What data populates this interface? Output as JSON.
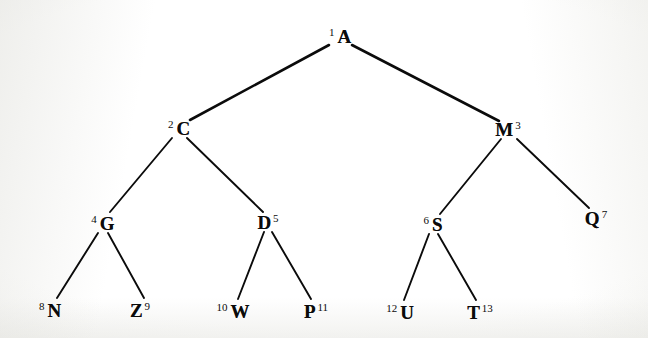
{
  "diagram": {
    "type": "tree",
    "width": 648,
    "height": 338,
    "background_color": "#fbfbf9",
    "ink_color": "#0b0b0b",
    "nodes": [
      {
        "id": "A",
        "label": "A",
        "number": "1",
        "number_side": "left",
        "x": 340,
        "y": 36,
        "level": 0
      },
      {
        "id": "C",
        "label": "C",
        "number": "2",
        "number_side": "left",
        "x": 179,
        "y": 128,
        "level": 1
      },
      {
        "id": "M",
        "label": "M",
        "number": "3",
        "number_side": "right",
        "x": 508,
        "y": 129,
        "level": 1
      },
      {
        "id": "G",
        "label": "G",
        "number": "4",
        "number_side": "left",
        "x": 103,
        "y": 223,
        "level": 2
      },
      {
        "id": "D",
        "label": "D",
        "number": "5",
        "number_side": "right",
        "x": 268,
        "y": 222,
        "level": 2
      },
      {
        "id": "S",
        "label": "S",
        "number": "6",
        "number_side": "left",
        "x": 433,
        "y": 224,
        "level": 2
      },
      {
        "id": "Q",
        "label": "Q",
        "number": "7",
        "number_side": "right",
        "x": 596,
        "y": 218,
        "level": 2
      },
      {
        "id": "N",
        "label": "N",
        "number": "8",
        "number_side": "left",
        "x": 50,
        "y": 310,
        "level": 3
      },
      {
        "id": "Z",
        "label": "Z",
        "number": "9",
        "number_side": "right",
        "x": 140,
        "y": 310,
        "level": 3
      },
      {
        "id": "W",
        "label": "W",
        "number": "10",
        "number_side": "left",
        "x": 233,
        "y": 311,
        "level": 3
      },
      {
        "id": "P",
        "label": "P",
        "number": "11",
        "number_side": "right",
        "x": 316,
        "y": 311,
        "level": 3
      },
      {
        "id": "U",
        "label": "U",
        "number": "12",
        "number_side": "left",
        "x": 400,
        "y": 312,
        "level": 3
      },
      {
        "id": "T",
        "label": "T",
        "number": "13",
        "number_side": "right",
        "x": 480,
        "y": 312,
        "level": 3
      }
    ],
    "edges": [
      {
        "from": "A",
        "to": "C",
        "x1": 329,
        "y1": 45,
        "x2": 190,
        "y2": 120
      },
      {
        "from": "A",
        "to": "M",
        "x1": 352,
        "y1": 45,
        "x2": 499,
        "y2": 121
      },
      {
        "from": "C",
        "to": "G",
        "x1": 172,
        "y1": 138,
        "x2": 110,
        "y2": 212
      },
      {
        "from": "C",
        "to": "D",
        "x1": 187,
        "y1": 138,
        "x2": 263,
        "y2": 212
      },
      {
        "from": "M",
        "to": "S",
        "x1": 501,
        "y1": 139,
        "x2": 440,
        "y2": 214
      },
      {
        "from": "M",
        "to": "Q",
        "x1": 517,
        "y1": 139,
        "x2": 589,
        "y2": 208
      },
      {
        "from": "G",
        "to": "N",
        "x1": 98,
        "y1": 233,
        "x2": 57,
        "y2": 298
      },
      {
        "from": "G",
        "to": "Z",
        "x1": 108,
        "y1": 233,
        "x2": 144,
        "y2": 298
      },
      {
        "from": "D",
        "to": "W",
        "x1": 264,
        "y1": 232,
        "x2": 238,
        "y2": 299
      },
      {
        "from": "D",
        "to": "P",
        "x1": 272,
        "y1": 232,
        "x2": 311,
        "y2": 299
      },
      {
        "from": "S",
        "to": "U",
        "x1": 429,
        "y1": 234,
        "x2": 404,
        "y2": 300
      },
      {
        "from": "S",
        "to": "T",
        "x1": 438,
        "y1": 234,
        "x2": 476,
        "y2": 300
      }
    ]
  }
}
